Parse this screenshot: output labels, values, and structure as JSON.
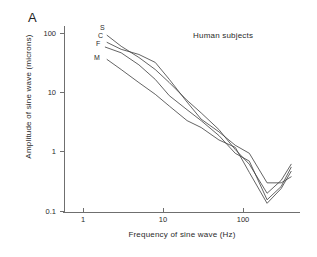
{
  "panel": {
    "label": "A"
  },
  "chart_data": {
    "type": "line",
    "title": "",
    "annotation": "Human subjects",
    "xlabel": "Frequency of sine wave (Hz)",
    "ylabel": "Amplitude of sine wave (microns)",
    "xscale": "log",
    "yscale": "log",
    "xlim": [
      0.7,
      420
    ],
    "ylim": [
      0.1,
      160
    ],
    "xticks": [
      1,
      10,
      100
    ],
    "xtick_labels": [
      "1",
      "10",
      "100"
    ],
    "yticks": [
      0.1,
      1,
      10,
      100
    ],
    "ytick_labels": [
      "0.1",
      "1",
      "10",
      "100"
    ],
    "grid": false,
    "legend": "inline-curve-labels",
    "series": [
      {
        "name": "S",
        "label": "S",
        "x": [
          2.0,
          3.0,
          5.0,
          8.0,
          12.0,
          20.0,
          30.0,
          50.0,
          80.0,
          120.0,
          200.0,
          300.0,
          400.0
        ],
        "y": [
          95.0,
          62.0,
          40.0,
          25.0,
          15.0,
          7.5,
          4.6,
          2.4,
          1.1,
          0.62,
          0.2,
          0.33,
          0.62
        ]
      },
      {
        "name": "C",
        "label": "C",
        "x": [
          2.0,
          3.0,
          5.0,
          8.0,
          12.0,
          20.0,
          30.0,
          50.0,
          80.0,
          120.0,
          200.0,
          300.0,
          400.0
        ],
        "y": [
          72.0,
          55.0,
          45.0,
          33.0,
          17.0,
          7.0,
          3.6,
          2.2,
          1.3,
          0.95,
          0.3,
          0.3,
          0.38
        ]
      },
      {
        "name": "F",
        "label": "F",
        "x": [
          1.9,
          3.0,
          5.0,
          8.0,
          12.0,
          20.0,
          30.0,
          50.0,
          80.0,
          120.0,
          200.0,
          300.0,
          400.0
        ],
        "y": [
          60.0,
          48.0,
          30.0,
          17.0,
          9.0,
          5.2,
          3.4,
          1.9,
          0.95,
          0.7,
          0.155,
          0.26,
          0.55
        ]
      },
      {
        "name": "M",
        "label": "M",
        "x": [
          2.0,
          3.0,
          5.0,
          8.0,
          12.0,
          20.0,
          30.0,
          50.0,
          80.0,
          120.0,
          200.0,
          300.0,
          400.0
        ],
        "y": [
          37.0,
          25.0,
          15.0,
          9.5,
          6.0,
          3.4,
          2.6,
          1.6,
          1.2,
          0.45,
          0.135,
          0.24,
          0.47
        ]
      }
    ]
  },
  "axis": {
    "ytick_0": "100",
    "ytick_1": "10",
    "ytick_2": "1",
    "ytick_3": "0.1",
    "xtick_0": "1",
    "xtick_1": "10",
    "xtick_2": "100"
  }
}
